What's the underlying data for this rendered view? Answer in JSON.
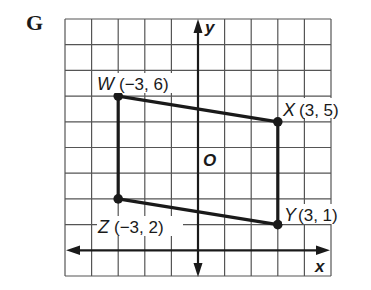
{
  "problem_label": "G",
  "axes": {
    "x_label": "x",
    "y_label": "y",
    "origin_label": "O"
  },
  "grid": {
    "x_range": [
      -5,
      5
    ],
    "y_range": [
      -1,
      9
    ]
  },
  "points": [
    {
      "name": "W",
      "coords": "(−3, 6)",
      "x": -3,
      "y": 6
    },
    {
      "name": "X",
      "coords": "(3, 5)",
      "x": 3,
      "y": 5
    },
    {
      "name": "Y",
      "coords": "(3, 1)",
      "x": 3,
      "y": 1
    },
    {
      "name": "Z",
      "coords": "(−3, 2)",
      "x": -3,
      "y": 2
    }
  ],
  "colors": {
    "grid": "#555555",
    "figure": "#1a1a1a"
  }
}
